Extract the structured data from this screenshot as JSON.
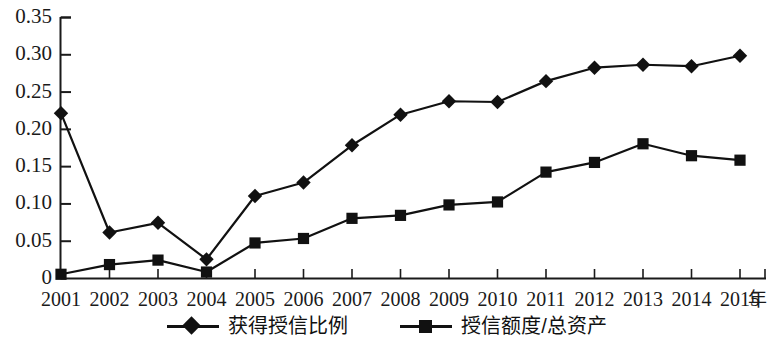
{
  "chart_data": {
    "type": "line",
    "title": "",
    "xlabel": "年",
    "ylabel": "",
    "categories": [
      "2001",
      "2002",
      "2003",
      "2004",
      "2005",
      "2006",
      "2007",
      "2008",
      "2009",
      "2010",
      "2011",
      "2012",
      "2013",
      "2014",
      "2015"
    ],
    "series": [
      {
        "name": "获得授信比例",
        "marker": "diamond",
        "color": "#111111",
        "values": [
          0.221,
          0.061,
          0.074,
          0.025,
          0.11,
          0.128,
          0.178,
          0.219,
          0.237,
          0.236,
          0.264,
          0.282,
          0.286,
          0.284,
          0.298
        ]
      },
      {
        "name": "授信额度/总资产",
        "marker": "square",
        "color": "#111111",
        "values": [
          0.005,
          0.018,
          0.024,
          0.008,
          0.047,
          0.053,
          0.08,
          0.084,
          0.098,
          0.102,
          0.142,
          0.155,
          0.18,
          0.164,
          0.158
        ]
      }
    ],
    "ylim": [
      0,
      0.35
    ],
    "yticks": [
      0,
      0.05,
      0.1,
      0.15,
      0.2,
      0.25,
      0.3,
      0.35
    ],
    "ytick_labels": [
      "0",
      "0.05",
      "0.10",
      "0.15",
      "0.20",
      "0.25",
      "0.30",
      "0.35"
    ],
    "grid": false,
    "legend_position": "bottom"
  },
  "axes": {
    "y_tick_labels": [
      "0.35",
      "0.30",
      "0.25",
      "0.20",
      "0.15",
      "0.10",
      "0.05",
      "0"
    ],
    "x_tick_labels": [
      "2001",
      "2002",
      "2003",
      "2004",
      "2005",
      "2006",
      "2007",
      "2008",
      "2009",
      "2010",
      "2011",
      "2012",
      "2013",
      "2014",
      "2015"
    ],
    "x_unit_label": "年"
  },
  "legend": {
    "items": [
      {
        "label": "获得授信比例",
        "marker": "diamond"
      },
      {
        "label": "授信额度/总资产",
        "marker": "square"
      }
    ]
  }
}
